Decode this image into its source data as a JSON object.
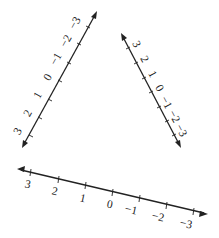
{
  "diagram": {
    "type": "number-lines",
    "lines": [
      {
        "id": "left",
        "start": [
          22,
          148
        ],
        "end": [
          97,
          11
        ],
        "labels": [
          "3",
          "2",
          "1",
          "0",
          "-1",
          "-2",
          "-3"
        ],
        "label_side": "left"
      },
      {
        "id": "right",
        "start": [
          121,
          33
        ],
        "end": [
          181,
          148
        ],
        "labels": [
          "3",
          "2",
          "1",
          "0",
          "-1",
          "-2",
          "-3"
        ],
        "label_side": "right"
      },
      {
        "id": "bottom",
        "start": [
          17,
          169
        ],
        "end": [
          208,
          214
        ],
        "labels": [
          "3",
          "2",
          "1",
          "0",
          "-1",
          "-2",
          "-3"
        ],
        "label_side": "below"
      }
    ]
  },
  "labels": {
    "left": [
      "3",
      "2",
      "1",
      "0",
      "−1",
      "−2",
      "−3"
    ],
    "right": [
      "3",
      "2",
      "1",
      "0",
      "−1",
      "−2",
      "−3"
    ],
    "bottom": [
      "3",
      "2",
      "1",
      "0",
      "−1",
      "−2",
      "−3"
    ]
  }
}
